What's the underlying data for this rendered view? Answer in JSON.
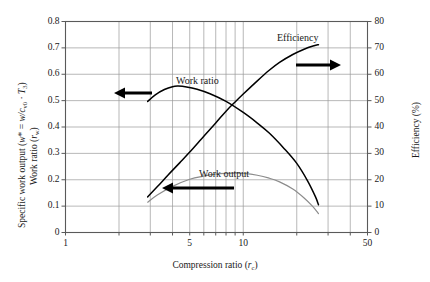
{
  "chart_data": {
    "type": "line",
    "title": "",
    "xlabel": "Compression ratio (r_c)",
    "ylabel_left": "Specific work output (w* = w/c_v0 · T_3)  /  Work ratio (r_w)",
    "ylabel_right": "Efficiency (%)",
    "xscale": "log",
    "xlim": [
      1,
      50
    ],
    "ylim_left": [
      0,
      0.8
    ],
    "ylim_right": [
      0,
      80
    ],
    "grid": true,
    "legend_position": "inline-annotations",
    "xticks_labeled": [
      "1",
      "5",
      "10",
      "50"
    ],
    "xticks_labeled_values": [
      1,
      5,
      10,
      50
    ],
    "xgridlines": [
      1,
      2,
      3,
      4,
      5,
      6,
      7,
      8,
      9,
      10,
      20,
      30,
      40,
      50
    ],
    "yticks_left": [
      "0",
      "0.1",
      "0.2",
      "0.3",
      "0.4",
      "0.5",
      "0.6",
      "0.7",
      "0.8"
    ],
    "yticks_left_values": [
      0,
      0.1,
      0.2,
      0.3,
      0.4,
      0.5,
      0.6,
      0.7,
      0.8
    ],
    "yticks_right": [
      "0",
      "10",
      "20",
      "30",
      "40",
      "50",
      "60",
      "70",
      "80"
    ],
    "yticks_right_values": [
      0,
      10,
      20,
      30,
      40,
      50,
      60,
      70,
      80
    ],
    "series": [
      {
        "name": "Efficiency",
        "axis": "right",
        "color": "#000000",
        "points_x": [
          2.9,
          3.3,
          3.8,
          4.4,
          5.0,
          6.0,
          7.0,
          8.0,
          9.0,
          10.0,
          12.0,
          14.0,
          16.0,
          19.0,
          22.0,
          25.0,
          26.5
        ],
        "points_y": [
          13.5,
          17.5,
          22.0,
          26.5,
          30.5,
          36.5,
          41.5,
          46.0,
          49.5,
          52.5,
          57.5,
          61.5,
          64.5,
          67.5,
          69.5,
          70.8,
          71.2
        ]
      },
      {
        "name": "Work ratio",
        "axis": "left",
        "color": "#000000",
        "points_x": [
          2.9,
          3.2,
          3.6,
          4.0,
          4.3,
          4.8,
          5.5,
          6.5,
          8.0,
          10.0,
          12.0,
          14.0,
          17.0,
          20.0,
          23.0,
          25.5,
          26.5
        ],
        "points_y": [
          0.497,
          0.522,
          0.542,
          0.553,
          0.555,
          0.552,
          0.543,
          0.526,
          0.497,
          0.455,
          0.415,
          0.377,
          0.318,
          0.262,
          0.196,
          0.135,
          0.105
        ]
      },
      {
        "name": "Work output",
        "axis": "left",
        "color": "#8c8c8c",
        "points_x": [
          2.9,
          3.3,
          4.0,
          5.0,
          6.0,
          7.0,
          8.0,
          9.0,
          10.0,
          12.0,
          14.0,
          16.0,
          19.0,
          22.0,
          24.5,
          26.5
        ],
        "points_y": [
          0.115,
          0.143,
          0.175,
          0.202,
          0.214,
          0.221,
          0.224,
          0.225,
          0.224,
          0.217,
          0.206,
          0.192,
          0.165,
          0.131,
          0.1,
          0.072
        ]
      }
    ],
    "annotations": [
      {
        "text": "Efficiency",
        "arrow": "right"
      },
      {
        "text": "Work ratio",
        "arrow": "left"
      },
      {
        "text": "Work output",
        "arrow": "left"
      }
    ]
  },
  "axis": {
    "left_title_line1_prefix": "Specific work output (",
    "left_title_line1_w": "w",
    "left_title_line1_star": "*",
    "left_title_line1_eq": " = ",
    "left_title_line1_wc": "w/c",
    "left_title_line1_sub1": "v0",
    "left_title_line1_dot": " · ",
    "left_title_line1_T": "T",
    "left_title_line1_sub2": "3",
    "left_title_line1_suffix": ")",
    "left_title_line2_prefix": "Work ratio (",
    "left_title_line2_r": "r",
    "left_title_line2_sub": "w",
    "left_title_line2_suffix": ")",
    "right_title": "Efficiency (%)",
    "x_title_prefix": "Compression ratio (",
    "x_title_r": "r",
    "x_title_sub": "c",
    "x_title_suffix": ")"
  },
  "labels": {
    "efficiency": "Efficiency",
    "work_ratio": "Work ratio",
    "work_output": "Work output"
  }
}
